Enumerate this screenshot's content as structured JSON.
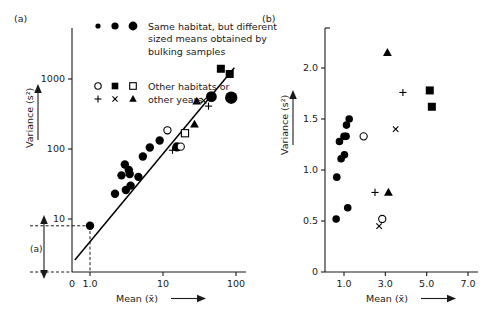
{
  "figure": {
    "panel_a_label": "(a)",
    "panel_b_label": "(b)"
  },
  "legend": {
    "rows": [
      {
        "markers": [
          "circle-filled-small",
          "circle-filled-medium",
          "circle-filled-large"
        ],
        "lines": [
          "Same habitat, but different",
          "sized means obtained by",
          "bulking samples"
        ]
      },
      {
        "markers": [
          "circle-open",
          "square-filled",
          "square-open"
        ],
        "lines": [
          "Other habitats or"
        ]
      },
      {
        "markers": [
          "plus",
          "cross",
          "triangle-filled"
        ],
        "lines": [
          "other years"
        ]
      }
    ]
  },
  "annotation": {
    "bracket_label": "(a)"
  },
  "chart_data": [
    {
      "type": "scatter",
      "id": "panel-a",
      "title": "(a)",
      "xlabel": "Mean (x̄)",
      "ylabel": "Variance (s²)",
      "xscale": "log",
      "yscale": "log",
      "xticks": [
        "0",
        "1.0",
        "10",
        "100"
      ],
      "xtick_values": [
        0.4,
        1.0,
        10,
        100
      ],
      "yticks": [
        "10",
        "100",
        "1000"
      ],
      "ytick_values": [
        10,
        100,
        1000
      ],
      "xlim": [
        0.4,
        130
      ],
      "ylim": [
        2.0,
        3000
      ],
      "grid": false,
      "legend_position": "top-left-inside",
      "fit_line": {
        "x1": 0.62,
        "y1": 2.6,
        "x2": 95,
        "y2": 1450
      },
      "reference_lines": {
        "x": 1.0,
        "y": 8.0,
        "style": "dashed"
      },
      "series": [
        {
          "name": "Same habitat, different sized means (bulking samples)",
          "marker": "circle-filled",
          "points": [
            {
              "x": 1.0,
              "y": 8.0,
              "size": 4.2
            },
            {
              "x": 2.2,
              "y": 23,
              "size": 4.2
            },
            {
              "x": 3.1,
              "y": 26,
              "size": 4.2
            },
            {
              "x": 2.7,
              "y": 42,
              "size": 4.2
            },
            {
              "x": 3.6,
              "y": 30,
              "size": 4.2
            },
            {
              "x": 3.0,
              "y": 60,
              "size": 4.2
            },
            {
              "x": 3.4,
              "y": 50,
              "size": 4.2
            },
            {
              "x": 3.5,
              "y": 44,
              "size": 4.2
            },
            {
              "x": 4.6,
              "y": 40,
              "size": 4.2
            },
            {
              "x": 5.3,
              "y": 78,
              "size": 4.2
            },
            {
              "x": 6.6,
              "y": 105,
              "size": 4.2
            },
            {
              "x": 9.0,
              "y": 132,
              "size": 4.2
            },
            {
              "x": 15.5,
              "y": 107,
              "size": 4.6
            },
            {
              "x": 46,
              "y": 560,
              "size": 5.4
            },
            {
              "x": 86,
              "y": 540,
              "size": 6.2
            }
          ]
        },
        {
          "name": "Other habitats or other years — open circle",
          "marker": "circle-open",
          "points": [
            {
              "x": 11.5,
              "y": 185,
              "size": 3.6
            },
            {
              "x": 17.5,
              "y": 108,
              "size": 3.6
            }
          ]
        },
        {
          "name": "Other habitats or other years — filled square",
          "marker": "square-filled",
          "points": [
            {
              "x": 62,
              "y": 1400,
              "size": 4.0
            },
            {
              "x": 82,
              "y": 1180,
              "size": 4.0
            }
          ]
        },
        {
          "name": "Other habitats or other years — open square",
          "marker": "square-open",
          "points": [
            {
              "x": 20,
              "y": 168,
              "size": 3.6
            }
          ]
        },
        {
          "name": "Other habitats or other years — plus",
          "marker": "plus",
          "points": [
            {
              "x": 13.5,
              "y": 96,
              "size": 3.6
            },
            {
              "x": 42,
              "y": 410,
              "size": 3.6
            }
          ]
        },
        {
          "name": "Other habitats or other years — cross",
          "marker": "cross",
          "points": [
            {
              "x": 36,
              "y": 490,
              "size": 3.4
            }
          ]
        },
        {
          "name": "Other habitats or other years — filled triangle",
          "marker": "triangle-filled",
          "points": [
            {
              "x": 29,
              "y": 480,
              "size": 4.0
            },
            {
              "x": 27,
              "y": 225,
              "size": 4.0
            }
          ]
        }
      ]
    },
    {
      "type": "scatter",
      "id": "panel-b",
      "title": "(b)",
      "xlabel": "Mean (x̄)",
      "ylabel": "Variance (s²)",
      "xscale": "linear",
      "yscale": "linear",
      "xticks": [
        "1.0",
        "3.0",
        "5.0",
        "7.0"
      ],
      "xtick_values": [
        1.0,
        3.0,
        5.0,
        7.0
      ],
      "yticks": [
        "0",
        "0.5",
        "1.0",
        "1.5",
        "2.0"
      ],
      "ytick_values": [
        0,
        0.5,
        1.0,
        1.5,
        2.0
      ],
      "xlim": [
        0.3,
        7.6
      ],
      "ylim": [
        0,
        2.42
      ],
      "grid": false,
      "legend_position": "none",
      "series": [
        {
          "name": "Same habitat, different sized means (bulking samples)",
          "marker": "circle-filled",
          "points": [
            {
              "x": 0.62,
              "y": 0.52,
              "size": 3.8
            },
            {
              "x": 0.65,
              "y": 0.93,
              "size": 3.8
            },
            {
              "x": 0.78,
              "y": 1.28,
              "size": 3.8
            },
            {
              "x": 0.86,
              "y": 1.11,
              "size": 3.8
            },
            {
              "x": 1.0,
              "y": 1.33,
              "size": 3.8
            },
            {
              "x": 1.02,
              "y": 1.15,
              "size": 3.8
            },
            {
              "x": 1.1,
              "y": 1.33,
              "size": 3.8
            },
            {
              "x": 1.12,
              "y": 1.44,
              "size": 3.8
            },
            {
              "x": 1.18,
              "y": 0.63,
              "size": 3.8
            },
            {
              "x": 1.25,
              "y": 1.5,
              "size": 3.8
            }
          ]
        },
        {
          "name": "Other habitats or other years — open circle",
          "marker": "circle-open",
          "points": [
            {
              "x": 1.95,
              "y": 1.33,
              "size": 3.6
            },
            {
              "x": 2.85,
              "y": 0.52,
              "size": 3.6
            }
          ]
        },
        {
          "name": "Other habitats or other years — filled square",
          "marker": "square-filled",
          "points": [
            {
              "x": 5.15,
              "y": 1.78,
              "size": 4.0
            },
            {
              "x": 5.25,
              "y": 1.62,
              "size": 4.0
            }
          ]
        },
        {
          "name": "Other habitats or other years — plus",
          "marker": "plus",
          "points": [
            {
              "x": 2.5,
              "y": 0.78,
              "size": 3.6
            },
            {
              "x": 3.85,
              "y": 1.76,
              "size": 3.6
            }
          ]
        },
        {
          "name": "Other habitats or other years — cross",
          "marker": "cross",
          "points": [
            {
              "x": 2.7,
              "y": 0.45,
              "size": 3.4
            },
            {
              "x": 3.5,
              "y": 1.4,
              "size": 3.4
            }
          ]
        },
        {
          "name": "Other habitats or other years — filled triangle",
          "marker": "triangle-filled",
          "points": [
            {
              "x": 3.15,
              "y": 0.78,
              "size": 4.0
            },
            {
              "x": 3.1,
              "y": 2.15,
              "size": 4.0
            }
          ]
        }
      ]
    }
  ]
}
